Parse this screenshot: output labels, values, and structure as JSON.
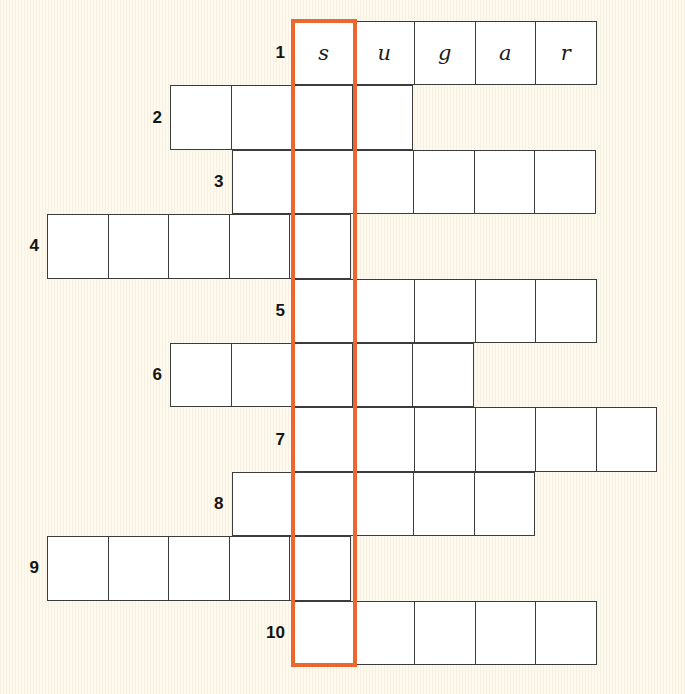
{
  "puzzle": {
    "title": "Crossword grid puzzle",
    "type": "crossword",
    "background_color": "#fdf9ed",
    "cell_fill_color": "#ffffff",
    "cell_border_color": "#3c3c3c",
    "highlight_color": "#ec6730",
    "number_color": "#141414",
    "cell_size": 61.5,
    "highlight_column_index": 0,
    "highlight": {
      "label": "highlighted-answer-column",
      "column": 0,
      "row_start": 1,
      "row_end": 10
    },
    "geometry": {
      "grid_top": 21,
      "row_height": 64.4,
      "col_width": 61.5,
      "highlight_left": 293
    },
    "rows": [
      {
        "number": "1",
        "offset": 0,
        "length": 5,
        "letters": [
          "s",
          "u",
          "g",
          "a",
          "r"
        ]
      },
      {
        "number": "2",
        "offset": -2,
        "length": 4,
        "letters": [
          "",
          "",
          "",
          ""
        ]
      },
      {
        "number": "3",
        "offset": -1,
        "length": 6,
        "letters": [
          "",
          "",
          "",
          "",
          "",
          ""
        ]
      },
      {
        "number": "4",
        "offset": -4,
        "length": 5,
        "letters": [
          "",
          "",
          "",
          "",
          ""
        ]
      },
      {
        "number": "5",
        "offset": 0,
        "length": 5,
        "letters": [
          "",
          "",
          "",
          "",
          ""
        ]
      },
      {
        "number": "6",
        "offset": -2,
        "length": 5,
        "letters": [
          "",
          "",
          "",
          "",
          ""
        ]
      },
      {
        "number": "7",
        "offset": 0,
        "length": 6,
        "letters": [
          "",
          "",
          "",
          "",
          "",
          ""
        ]
      },
      {
        "number": "8",
        "offset": -1,
        "length": 5,
        "letters": [
          "",
          "",
          "",
          "",
          ""
        ]
      },
      {
        "number": "9",
        "offset": -4,
        "length": 5,
        "letters": [
          "",
          "",
          "",
          "",
          ""
        ]
      },
      {
        "number": "10",
        "offset": 0,
        "length": 5,
        "letters": [
          "",
          "",
          "",
          "",
          ""
        ]
      }
    ]
  }
}
